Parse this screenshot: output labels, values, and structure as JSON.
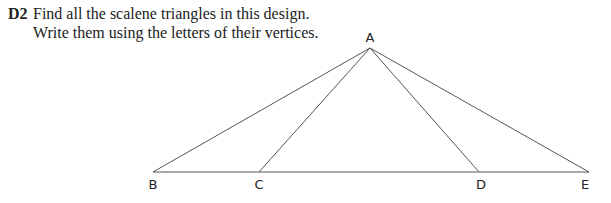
{
  "question": {
    "number": "D2",
    "lines": [
      "Find all the scalene triangles in this design.",
      "Write them using the letters of their vertices."
    ]
  },
  "diagram": {
    "line_color": "#555555",
    "points": {
      "A": {
        "label": "A",
        "x": 370,
        "y": 48
      },
      "B": {
        "label": "B",
        "x": 153,
        "y": 172
      },
      "C": {
        "label": "C",
        "x": 259,
        "y": 172
      },
      "D": {
        "label": "D",
        "x": 479,
        "y": 172
      },
      "E": {
        "label": "E",
        "x": 589,
        "y": 172
      }
    }
  }
}
